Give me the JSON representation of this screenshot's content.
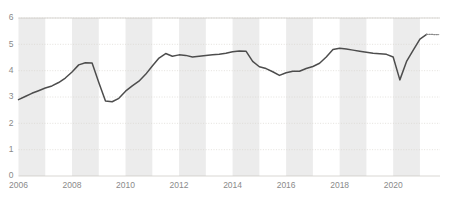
{
  "chart_data": {
    "type": "line",
    "title": "",
    "subtitle": "",
    "xlabel": "",
    "ylabel": "",
    "xlim": [
      2006.0,
      2021.75
    ],
    "ylim": [
      0,
      6
    ],
    "grid": true,
    "legend_position": "none",
    "y_ticks": [
      0,
      1,
      2,
      3,
      4,
      5,
      6
    ],
    "y_tick_labels": [
      "0",
      "1",
      "2",
      "3",
      "4",
      "5",
      "6"
    ],
    "x_ticks": [
      2006,
      2008,
      2010,
      2012,
      2014,
      2016,
      2018,
      2020
    ],
    "x_tick_labels": [
      "2006",
      "2008",
      "2010",
      "2012",
      "2014",
      "2016",
      "2018",
      "2020"
    ],
    "alternating_year_bands": true,
    "band_color": "#ececec",
    "line_color": "#4d4d4d",
    "grid_color": "#d9d6cf",
    "tick_label_color": "#8a8a8a",
    "background_color": "#ffffff",
    "series": [
      {
        "name": "series-1",
        "style": "solid",
        "x": [
          2006.0,
          2006.25,
          2006.5,
          2006.75,
          2007.0,
          2007.25,
          2007.5,
          2007.75,
          2008.0,
          2008.25,
          2008.5,
          2008.75,
          2009.0,
          2009.25,
          2009.5,
          2009.75,
          2010.0,
          2010.25,
          2010.5,
          2010.75,
          2011.0,
          2011.25,
          2011.5,
          2011.75,
          2012.0,
          2012.25,
          2012.5,
          2012.75,
          2013.0,
          2013.25,
          2013.5,
          2013.75,
          2014.0,
          2014.25,
          2014.5,
          2014.75,
          2015.0,
          2015.25,
          2015.5,
          2015.75,
          2016.0,
          2016.25,
          2016.5,
          2016.75,
          2017.0,
          2017.25,
          2017.5,
          2017.75,
          2018.0,
          2018.25,
          2018.5,
          2018.75,
          2019.0,
          2019.25,
          2019.5,
          2019.75,
          2020.0,
          2020.25,
          2020.5,
          2020.75,
          2021.0,
          2021.25
        ],
        "y": [
          2.9,
          3.02,
          3.14,
          3.24,
          3.34,
          3.42,
          3.55,
          3.72,
          3.95,
          4.22,
          4.3,
          4.29,
          3.55,
          2.85,
          2.82,
          2.95,
          3.22,
          3.42,
          3.6,
          3.86,
          4.18,
          4.48,
          4.65,
          4.55,
          4.6,
          4.58,
          4.52,
          4.55,
          4.58,
          4.6,
          4.62,
          4.66,
          4.72,
          4.75,
          4.74,
          4.35,
          4.15,
          4.08,
          3.96,
          3.82,
          3.92,
          3.98,
          3.98,
          4.08,
          4.16,
          4.28,
          4.52,
          4.8,
          4.85,
          4.82,
          4.78,
          4.74,
          4.7,
          4.66,
          4.64,
          4.62,
          4.52,
          3.65,
          4.35,
          4.78,
          5.2,
          5.38
        ]
      },
      {
        "name": "series-1-projection",
        "style": "dotted",
        "x": [
          2021.25,
          2021.4,
          2021.55,
          2021.7
        ],
        "y": [
          5.38,
          5.38,
          5.37,
          5.37
        ]
      }
    ]
  }
}
